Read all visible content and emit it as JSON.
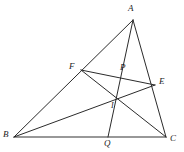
{
  "figure": {
    "width": 184,
    "height": 152,
    "background_color": "#ffffff",
    "line_color": "#2b2b2b",
    "label_color": "#1c1c1c"
  },
  "points": {
    "A": {
      "label": "A",
      "x": 133,
      "y": 20,
      "label_x": 128,
      "label_y": 4
    },
    "B": {
      "label": "B",
      "x": 14,
      "y": 137,
      "label_x": 3,
      "label_y": 130
    },
    "C": {
      "label": "C",
      "x": 166,
      "y": 137,
      "label_x": 170,
      "label_y": 134
    },
    "E": {
      "label": "E",
      "x": 155,
      "y": 85,
      "label_x": 159,
      "label_y": 77
    },
    "F": {
      "label": "F",
      "x": 81,
      "y": 70,
      "label_x": 69,
      "label_y": 62
    },
    "P": {
      "label": "P",
      "x": 123,
      "y": 76,
      "label_x": 120,
      "label_y": 63
    },
    "I": {
      "label": "I",
      "x": 117,
      "y": 99,
      "label_x": 111,
      "label_y": 102
    },
    "Q": {
      "label": "Q",
      "x": 108,
      "y": 137,
      "label_x": 104,
      "label_y": 139
    }
  },
  "segments": [
    {
      "name": "side-AB",
      "from": "A",
      "to": "B",
      "d": "M 133 20 L 14 137"
    },
    {
      "name": "side-AC",
      "from": "A",
      "to": "C",
      "d": "M 133 20 L 166 137"
    },
    {
      "name": "side-BC",
      "from": "B",
      "to": "C",
      "d": "M 14 137 L 166 137"
    },
    {
      "name": "segment-FE",
      "from": "F",
      "to": "E",
      "d": "M 81 70 L 155 85"
    },
    {
      "name": "cevian-FC",
      "from": "F",
      "to": "C",
      "d": "M 81 70 L 166 137"
    },
    {
      "name": "cevian-BE",
      "from": "B",
      "to": "E",
      "d": "M 14 137 L 155 85"
    },
    {
      "name": "cevian-AQ",
      "from": "A",
      "to": "Q",
      "d": "M 133 20 L 108 137"
    }
  ]
}
